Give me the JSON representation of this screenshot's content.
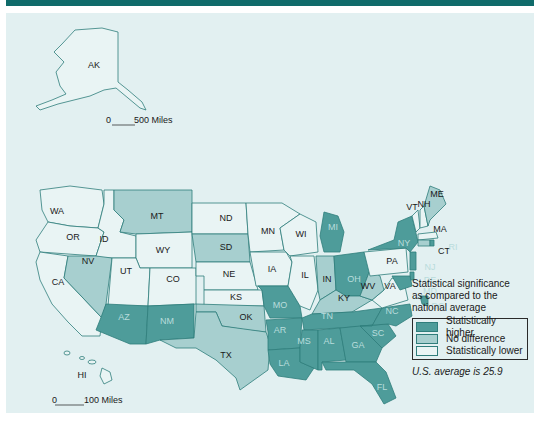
{
  "colors": {
    "higher": "#4e9c9a",
    "nodiff": "#a7cfcf",
    "lower": "#e9f4f4",
    "border": "#2f7d7b",
    "header": "#0f6b6a",
    "background": "#e2f0f1"
  },
  "scales": {
    "alaska": {
      "zero": "0",
      "label": "500 Miles"
    },
    "hawaii": {
      "zero": "0",
      "label": "100 Miles"
    }
  },
  "legend": {
    "title_line1": "Statistical significance",
    "title_line2": "as compared to the",
    "title_line3": "national average",
    "items": [
      {
        "key": "higher",
        "label": "Statistically higher"
      },
      {
        "key": "nodiff",
        "label": "No difference"
      },
      {
        "key": "lower",
        "label": "Statistically lower"
      }
    ],
    "note": "U.S. average is 25.9"
  },
  "chart_data": {
    "type": "choropleth",
    "title": "",
    "legend_title": "Statistical significance as compared to the national average",
    "note": "U.S. average is 25.9",
    "national_average": 25.9,
    "categories": [
      "Statistically higher",
      "No difference",
      "Statistically lower"
    ],
    "states": {
      "AK": "lower",
      "HI": "lower",
      "WA": "lower",
      "OR": "lower",
      "CA": "lower",
      "ID": "lower",
      "NV": "nodiff",
      "MT": "nodiff",
      "WY": "lower",
      "UT": "lower",
      "CO": "lower",
      "AZ": "higher",
      "NM": "higher",
      "ND": "lower",
      "SD": "nodiff",
      "NE": "lower",
      "KS": "lower",
      "OK": "nodiff",
      "TX": "nodiff",
      "MN": "lower",
      "IA": "lower",
      "MO": "higher",
      "AR": "higher",
      "LA": "higher",
      "WI": "lower",
      "IL": "lower",
      "MI": "higher",
      "IN": "nodiff",
      "OH": "higher",
      "KY": "nodiff",
      "TN": "higher",
      "MS": "higher",
      "AL": "higher",
      "GA": "higher",
      "FL": "higher",
      "SC": "higher",
      "NC": "higher",
      "VA": "lower",
      "WV": "nodiff",
      "PA": "lower",
      "NY": "higher",
      "VT": "lower",
      "NH": "lower",
      "ME": "nodiff",
      "MA": "lower",
      "RI": "higher",
      "CT": "nodiff",
      "NJ": "higher",
      "DE": "higher",
      "MD": "higher",
      "DC": "higher"
    }
  },
  "map": {
    "states": [
      {
        "id": "WA",
        "label": "WA",
        "lx": 57,
        "ly": 212,
        "pts": "40,190 70,186 102,190 104,204 98,228 70,226 48,222 42,210"
      },
      {
        "id": "OR",
        "label": "OR",
        "lx": 73,
        "ly": 238,
        "pts": "48,222 70,226 98,228 104,232 96,256 40,252 36,240"
      },
      {
        "id": "CA",
        "label": "CA",
        "lx": 58,
        "ly": 283,
        "pts": "40,252 68,256 64,278 102,318 100,336 82,336 68,322 52,304 40,280 36,262"
      },
      {
        "id": "ID",
        "label": "ID",
        "lx": 104,
        "ly": 240,
        "pts": "104,190 114,190 114,210 124,220 120,232 136,236 136,258 100,258 96,256 104,232 98,228 104,204"
      },
      {
        "id": "NV",
        "label": "NV",
        "lx": 88,
        "ly": 262,
        "pts": "68,256 96,256 112,258 106,304 102,318 64,278"
      },
      {
        "id": "MT",
        "label": "MT",
        "lx": 157,
        "ly": 217,
        "pts": "114,190 192,190 192,232 136,234 120,232 124,220 114,210"
      },
      {
        "id": "WY",
        "label": "WY",
        "lx": 163,
        "ly": 251,
        "pts": "136,234 192,232 192,268 140,268 136,258"
      },
      {
        "id": "UT",
        "label": "UT",
        "lx": 126,
        "ly": 272,
        "pts": "112,258 136,258 140,268 150,268 148,306 108,306"
      },
      {
        "id": "CO",
        "label": "CO",
        "lx": 173,
        "ly": 280,
        "pts": "150,268 196,268 196,304 148,306"
      },
      {
        "id": "AZ",
        "label": "AZ",
        "lx": 124,
        "ly": 318,
        "pts": "106,304 148,306 146,344 130,344 96,330 100,320"
      },
      {
        "id": "NM",
        "label": "NM",
        "lx": 167,
        "ly": 322,
        "pts": "148,306 194,304 194,338 160,340 146,344"
      },
      {
        "id": "ND",
        "label": "ND",
        "lx": 226,
        "ly": 219,
        "pts": "192,203 246,203 248,234 192,234"
      },
      {
        "id": "SD",
        "label": "SD",
        "lx": 226,
        "ly": 248,
        "pts": "192,234 248,234 250,262 196,262"
      },
      {
        "id": "NE",
        "label": "NE",
        "lx": 229,
        "ly": 275,
        "pts": "196,262 250,262 258,290 204,290 204,276 196,276"
      },
      {
        "id": "KS",
        "label": "KS",
        "lx": 236,
        "ly": 298,
        "pts": "204,290 262,290 264,306 204,306"
      },
      {
        "id": "OK",
        "label": "OK",
        "lx": 246,
        "ly": 318,
        "pts": "196,304 264,306 266,332 246,330 222,326 216,312 196,312"
      },
      {
        "id": "TX",
        "label": "TX",
        "lx": 226,
        "ly": 356,
        "pts": "196,312 216,312 222,326 266,332 270,344 268,370 240,390 236,378 216,360 196,348 176,348 160,340 194,338"
      },
      {
        "id": "MN",
        "label": "MN",
        "lx": 268,
        "ly": 232,
        "pts": "246,203 282,203 300,214 280,228 284,250 250,252 248,234"
      },
      {
        "id": "IA",
        "label": "IA",
        "lx": 272,
        "ly": 270,
        "pts": "250,252 286,252 292,262 288,286 256,286"
      },
      {
        "id": "MO",
        "label": "MO",
        "lx": 280,
        "ly": 306,
        "pts": "258,286 288,286 300,306 302,318 270,318 264,306 262,290"
      },
      {
        "id": "AR",
        "label": "AR",
        "lx": 280,
        "ly": 331,
        "pts": "266,320 302,318 300,348 268,350 268,332"
      },
      {
        "id": "LA",
        "label": "LA",
        "lx": 284,
        "ly": 364,
        "pts": "268,350 300,348 300,362 314,368 306,380 278,376 270,364"
      },
      {
        "id": "WI",
        "label": "WI",
        "lx": 301,
        "ly": 235,
        "pts": "280,228 300,214 316,222 318,252 290,256 286,252 284,250"
      },
      {
        "id": "IL",
        "label": "IL",
        "lx": 305,
        "ly": 276,
        "pts": "290,256 314,256 318,290 310,310 300,306 288,286 292,262"
      },
      {
        "id": "MI",
        "label": "MI",
        "lx": 333,
        "ly": 228,
        "pts": "324,212 338,216 344,232 340,252 324,252 320,236"
      },
      {
        "id": "IN",
        "label": "IN",
        "lx": 327,
        "ly": 280,
        "pts": "316,256 334,256 336,290 320,300 318,290"
      },
      {
        "id": "OH",
        "label": "OH",
        "lx": 354,
        "ly": 280,
        "pts": "334,256 364,252 370,270 360,296 346,296 336,290"
      },
      {
        "id": "KY",
        "label": "KY",
        "lx": 344,
        "ly": 299,
        "pts": "320,300 336,290 346,296 360,296 372,300 352,312 312,314"
      },
      {
        "id": "TN",
        "label": "TN",
        "lx": 327,
        "ly": 317,
        "pts": "302,318 312,314 352,312 382,308 372,326 304,330"
      },
      {
        "id": "MS",
        "label": "MS",
        "lx": 304,
        "ly": 342,
        "pts": "302,330 318,330 318,370 300,362 300,348"
      },
      {
        "id": "AL",
        "label": "AL",
        "lx": 329,
        "ly": 342,
        "pts": "318,330 340,328 346,360 322,362 322,370 318,370"
      },
      {
        "id": "GA",
        "label": "GA",
        "lx": 358,
        "ly": 346,
        "pts": "340,328 360,326 382,348 376,362 346,362"
      },
      {
        "id": "FL",
        "label": "FL",
        "lx": 382,
        "ly": 388,
        "pts": "322,362 376,362 386,372 396,398 384,404 372,384 354,370 326,370"
      },
      {
        "id": "SC",
        "label": "SC",
        "lx": 378,
        "ly": 334,
        "pts": "360,326 388,324 396,336 382,348"
      },
      {
        "id": "NC",
        "label": "NC",
        "lx": 392,
        "ly": 312,
        "pts": "372,326 382,308 410,304 412,316 396,326 388,324 360,326"
      },
      {
        "id": "VA",
        "label": "VA",
        "lx": 390,
        "ly": 287,
        "pts": "372,300 384,290 392,278 404,282 408,300 382,308"
      },
      {
        "id": "WV",
        "label": "WV",
        "lx": 368,
        "ly": 287,
        "pts": "360,296 370,270 380,276 384,290 372,300"
      },
      {
        "id": "PA",
        "label": "PA",
        "lx": 392,
        "ly": 262,
        "pts": "364,252 406,248 408,272 370,276"
      },
      {
        "id": "NY",
        "label": "NY",
        "lx": 404,
        "ly": 244,
        "pts": "368,250 394,240 398,222 412,216 418,242 410,252 406,248"
      },
      {
        "id": "VT",
        "label": "VT",
        "lx": 412,
        "ly": 208,
        "pts": "412,216 418,210 420,228 416,232"
      },
      {
        "id": "NH",
        "label": "NH",
        "lx": 424,
        "ly": 205,
        "pts": "420,210 424,206 428,226 420,228"
      },
      {
        "id": "ME",
        "label": "ME",
        "lx": 437,
        "ly": 195,
        "pts": "424,206 430,186 440,190 446,204 430,220 428,226"
      },
      {
        "id": "MA",
        "label": "MA",
        "lx": 440,
        "ly": 230,
        "pts": "418,234 436,232 438,238 418,240"
      },
      {
        "id": "CT",
        "label": "CT",
        "lx": 444,
        "ly": 252,
        "pts": "418,240 430,240 430,246 418,246"
      },
      {
        "id": "RI",
        "label": "RI",
        "lx": 453,
        "ly": 248,
        "pts": "430,240 434,240 434,246 430,246"
      },
      {
        "id": "NJ",
        "label": "NJ",
        "lx": 430,
        "ly": 268,
        "pts": "410,252 416,252 416,270 410,270"
      },
      {
        "id": "DE",
        "label": "DE",
        "lx": 430,
        "ly": 281,
        "pts": "410,272 414,272 414,280 410,280"
      },
      {
        "id": "MD",
        "label": "MD",
        "lx": 430,
        "ly": 292,
        "pts": "392,276 410,276 412,286 400,290"
      },
      {
        "id": "DC",
        "label": "DC",
        "lx": 438,
        "ly": 307,
        "pts": "420,296 428,296 428,306 422,304"
      }
    ]
  }
}
